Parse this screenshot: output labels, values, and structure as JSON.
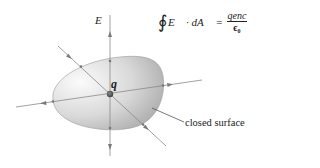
{
  "diagram": {
    "field_label": "E",
    "charge_label": "q",
    "surface_label": "closed surface",
    "formula": {
      "integral": "∮",
      "lhs": "E⃗ · dA⃗",
      "equals": "=",
      "numerator": "q_enc",
      "numerator_display": "qenc",
      "denominator": "ε₀",
      "denominator_display": "ϵ₀"
    },
    "colors": {
      "line": "#8a8a8a",
      "surface_fill_light": "#f4f4f4",
      "surface_fill_dark": "#b8b8b8",
      "charge": "#555555"
    }
  }
}
